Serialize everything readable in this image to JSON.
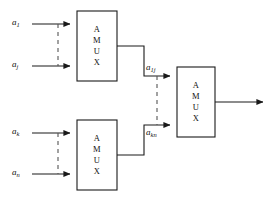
{
  "figure": {
    "background_color": "#ffffff",
    "line_color": "#1a1a1a",
    "dashed_color": "#555555"
  },
  "blocks": [
    {
      "id": "amux-top-left",
      "label": "A\nM\nU\nX",
      "x": 77,
      "y": 11,
      "w": 40,
      "h": 70
    },
    {
      "id": "amux-bottom-left",
      "label": "A\nM\nU\nX",
      "x": 77,
      "y": 120,
      "w": 40,
      "h": 70
    },
    {
      "id": "amux-right",
      "label": "A\nM\nU\nX",
      "x": 177,
      "y": 67,
      "w": 38,
      "h": 70
    }
  ],
  "signals": {
    "input_1": {
      "base": "a",
      "sub": "1"
    },
    "input_j": {
      "base": "a",
      "sub": "j"
    },
    "input_k": {
      "base": "a",
      "sub": "k"
    },
    "input_n": {
      "base": "a",
      "sub": "n"
    },
    "mid_1j": {
      "base": "a",
      "sub": "1j"
    },
    "mid_kn": {
      "base": "a",
      "sub": "kn"
    }
  }
}
